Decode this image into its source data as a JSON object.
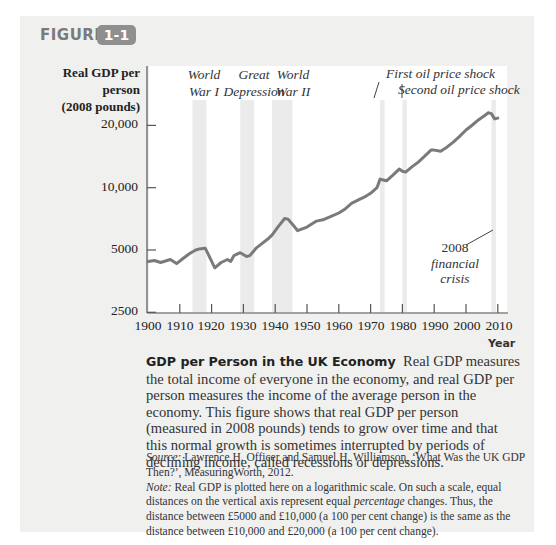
{
  "figure": {
    "label": "FIGURE",
    "number": "1-1"
  },
  "colors": {
    "panel_bg": "#f0f0ef",
    "badge_bg": "#8f8f8f",
    "line": "#7a7a7a",
    "band": "#ebebeb",
    "axis": "#555555"
  },
  "chart_data": {
    "type": "line",
    "title": "GDP per Person in the UK Economy",
    "xlabel": "Year",
    "ylabel": "Real GDP per person (2008 pounds)",
    "yscale": "log",
    "ylim": [
      2500,
      25000
    ],
    "xlim": [
      1900,
      2010
    ],
    "yticks": [
      2500,
      5000,
      10000,
      20000
    ],
    "ytick_labels": [
      "2500",
      "5000",
      "10,000",
      "20,000"
    ],
    "xticks": [
      1900,
      1910,
      1920,
      1930,
      1940,
      1950,
      1960,
      1970,
      1980,
      1990,
      2000,
      2010
    ],
    "grid": false,
    "legend": null,
    "series": [
      {
        "name": "Real GDP per person",
        "x": [
          1900,
          1902,
          1904,
          1906,
          1907,
          1909,
          1911,
          1913,
          1915,
          1916,
          1918,
          1919,
          1921,
          1923,
          1925,
          1926,
          1927,
          1929,
          1931,
          1932,
          1934,
          1936,
          1938,
          1939,
          1941,
          1943,
          1944,
          1946,
          1947,
          1950,
          1953,
          1955,
          1957,
          1960,
          1962,
          1964,
          1966,
          1968,
          1970,
          1972,
          1973,
          1974,
          1975,
          1977,
          1979,
          1980,
          1981,
          1983,
          1985,
          1987,
          1989,
          1990,
          1992,
          1994,
          1996,
          1998,
          2000,
          2002,
          2004,
          2006,
          2007,
          2008,
          2009,
          2010
        ],
        "values": [
          4400,
          4450,
          4350,
          4450,
          4500,
          4300,
          4550,
          4800,
          5000,
          5050,
          5100,
          4750,
          4100,
          4350,
          4500,
          4400,
          4700,
          4850,
          4650,
          4700,
          5100,
          5400,
          5700,
          5900,
          6500,
          7100,
          7050,
          6500,
          6200,
          6450,
          6900,
          7000,
          7200,
          7550,
          7900,
          8400,
          8700,
          9000,
          9400,
          10000,
          11000,
          10900,
          10800,
          11500,
          12300,
          12000,
          11900,
          12600,
          13300,
          14200,
          15200,
          15200,
          15000,
          15700,
          16600,
          17700,
          19000,
          20100,
          21300,
          22400,
          23000,
          22800,
          21500,
          21700
        ]
      }
    ],
    "shaded_periods": [
      {
        "label": "World War I",
        "start": 1914,
        "end": 1918
      },
      {
        "label": "Great Depression",
        "start": 1929,
        "end": 1933
      },
      {
        "label": "World War II",
        "start": 1939,
        "end": 1945
      },
      {
        "label": "First oil price shock",
        "start": 1973,
        "end": 1974
      },
      {
        "label": "Second oil price shock",
        "start": 1980,
        "end": 1981
      },
      {
        "label": "2008 financial crisis",
        "start": 2008,
        "end": 2009
      }
    ]
  },
  "axis": {
    "ylabel_line1": "Real GDP per person",
    "ylabel_line2": "(2008 pounds)",
    "xlabel": "Year",
    "yticks": [
      "20,000",
      "10,000",
      "5000",
      "2500"
    ],
    "xticks": [
      "1900",
      "1910",
      "1920",
      "1930",
      "1940",
      "1950",
      "1960",
      "1970",
      "1980",
      "1990",
      "2000",
      "2010"
    ]
  },
  "annotations": {
    "ww1_line1": "World",
    "ww1_line2": "War I",
    "dep_line1": "Great",
    "dep_line2": "Depression",
    "ww2_line1": "World",
    "ww2_line2": "War II",
    "oil1": "First oil price shock",
    "oil2": "Second oil price shock",
    "crisis_line1": "2008",
    "crisis_line2": "financial",
    "crisis_line3": "crisis"
  },
  "caption": {
    "title": "GDP per Person in the UK Economy",
    "body": "Real GDP measures the total income of everyone in the economy, and real GDP per person measures the income of the average person in the economy. This figure shows that real GDP per person (measured in 2008 pounds) tends to grow over time and that this normal growth is sometimes interrupted by periods of declining income, called recessions or depressions."
  },
  "notes": {
    "source_label": "Source:",
    "source_text": "Lawrence H. Officer and Samuel H. Williamson, ‘What Was the UK GDP Then?’, MeasuringWorth, 2012.",
    "note_label": "Note:",
    "note_text_1": "Real GDP is plotted here on a logarithmic scale. On such a scale, equal distances on the vertical axis represent equal",
    "note_emph": "percentage",
    "note_text_2": "changes. Thus, the distance between £5000 and £10,000 (a 100 per cent change) is the same as the distance between £10,000 and £20,000 (a 100 per cent change)."
  }
}
